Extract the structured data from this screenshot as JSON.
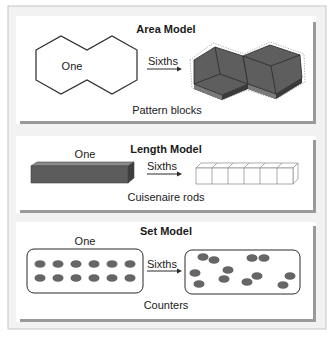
{
  "colors": {
    "frame_bg": "#f1f1f1",
    "frame_border": "#c8c8c8",
    "panel_bg": "#ffffff",
    "panel_shadow": "#9a9a9a",
    "block_dark": "#5c5c5c",
    "block_side": "#3e3e3e",
    "outline": "#2b2b2b",
    "counter": "#666666"
  },
  "panels": [
    {
      "id": "area",
      "title": "Area Model",
      "whole_label": "One",
      "arrow_label": "Sixths",
      "caption": "Pattern blocks"
    },
    {
      "id": "length",
      "title": "Length Model",
      "whole_label": "One",
      "arrow_label": "Sixths",
      "caption": "Cuisenaire rods"
    },
    {
      "id": "set",
      "title": "Set Model",
      "whole_label": "One",
      "arrow_label": "Sixths",
      "caption": "Counters"
    }
  ]
}
